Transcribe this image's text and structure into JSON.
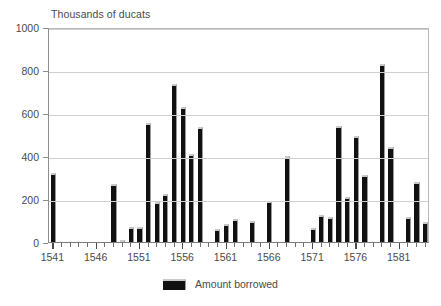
{
  "chart_data": {
    "type": "bar",
    "title": "",
    "subtitle": "",
    "xlabel": "",
    "ylabel": "Thousands of ducats",
    "ylim": [
      0,
      1000
    ],
    "yticks": [
      0,
      200,
      400,
      600,
      800,
      1000
    ],
    "grid": true,
    "legend_position": "bottom",
    "legend": [
      "Amount borrowed"
    ],
    "xlim": [
      1540.5,
      1584.5
    ],
    "xticks": [
      1541,
      1546,
      1551,
      1556,
      1561,
      1566,
      1571,
      1576,
      1581
    ],
    "xticklabels": [
      "1541",
      "1546",
      "1551",
      "1556",
      "1561",
      "1566",
      "1571",
      "1576",
      "1581"
    ],
    "series": [
      {
        "name": "Amount borrowed",
        "color": "#111111",
        "categories": [
          1541,
          1542,
          1543,
          1544,
          1545,
          1546,
          1547,
          1548,
          1549,
          1550,
          1551,
          1552,
          1553,
          1554,
          1555,
          1556,
          1557,
          1558,
          1559,
          1560,
          1561,
          1562,
          1563,
          1564,
          1565,
          1566,
          1567,
          1568,
          1569,
          1570,
          1571,
          1572,
          1573,
          1574,
          1575,
          1576,
          1577,
          1578,
          1579,
          1580,
          1581,
          1582,
          1583,
          1584
        ],
        "values": [
          320,
          0,
          0,
          0,
          0,
          0,
          0,
          270,
          10,
          70,
          70,
          555,
          185,
          225,
          735,
          630,
          410,
          535,
          0,
          60,
          85,
          105,
          0,
          100,
          0,
          190,
          0,
          400,
          0,
          0,
          65,
          125,
          115,
          540,
          210,
          495,
          310,
          0,
          830,
          440,
          0,
          115,
          280,
          95
        ]
      }
    ]
  },
  "axis_title": {
    "text": "Thousands of ducats"
  },
  "legend_entry": {
    "label": "Amount borrowed"
  }
}
